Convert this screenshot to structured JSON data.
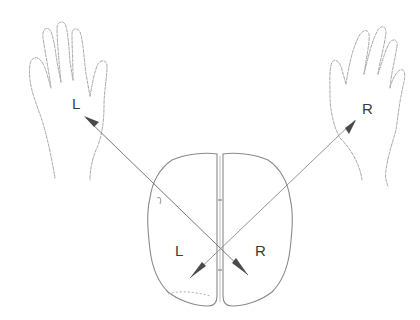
{
  "diagram": {
    "type": "contralateral-brain-control",
    "labels": {
      "left_hand": "L",
      "right_hand": "R",
      "left_hemisphere": "L",
      "right_hemisphere": "R"
    },
    "colors": {
      "outline": "#9a9a9a",
      "line": "#6a6a6a",
      "arrowhead": "#4a4a4a",
      "text": "#3a3a3a",
      "background": "#ffffff"
    }
  }
}
